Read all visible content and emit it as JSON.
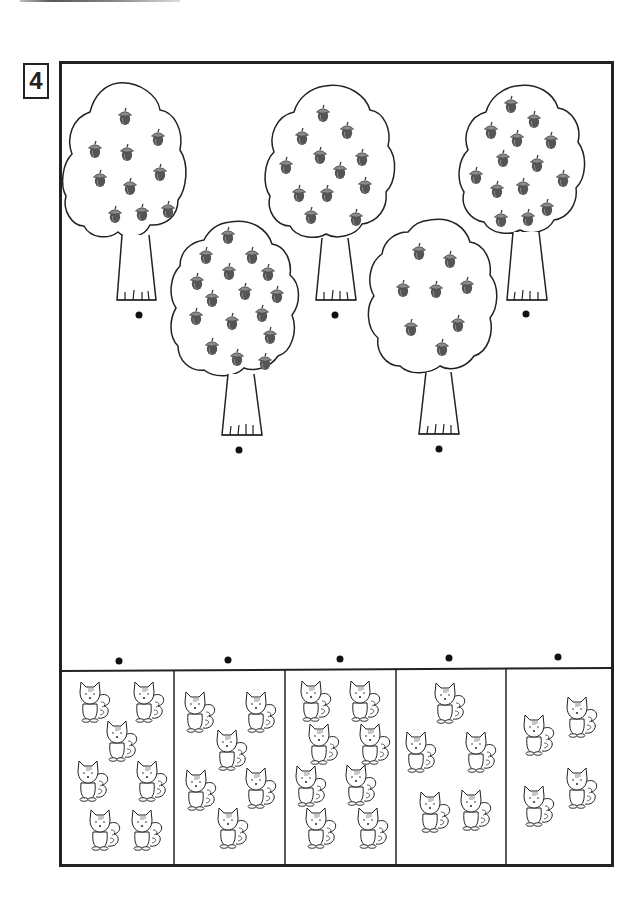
{
  "worksheet": {
    "exercise_number": "4",
    "instructions": "Match each tree to the box with the same number of squirrels as acorns/ by quantity (no visible text)",
    "trees": [
      {
        "id": "tree-1",
        "acorn_count": 10,
        "cx": 120,
        "cy": 175,
        "scale": 1.0,
        "dot": [
          139,
          315
        ]
      },
      {
        "id": "tree-2",
        "acorn_count": 15,
        "cx": 235,
        "cy": 300,
        "scale": 1.05,
        "dot": [
          239,
          450
        ]
      },
      {
        "id": "tree-3",
        "acorn_count": 12,
        "cx": 328,
        "cy": 165,
        "scale": 1.02,
        "dot": [
          335,
          315
        ]
      },
      {
        "id": "tree-4",
        "acorn_count": 8,
        "cx": 432,
        "cy": 300,
        "scale": 1.02,
        "dot": [
          439,
          449
        ]
      },
      {
        "id": "tree-5",
        "acorn_count": 14,
        "cx": 518,
        "cy": 160,
        "scale": 0.98,
        "dot": [
          526,
          314
        ]
      }
    ],
    "squirrel_boxes": [
      {
        "id": "box-1",
        "squirrel_count": 7,
        "dot": [
          119,
          661
        ]
      },
      {
        "id": "box-2",
        "squirrel_count": 6,
        "dot": [
          228,
          660
        ]
      },
      {
        "id": "box-3",
        "squirrel_count": 8,
        "dot": [
          340,
          659
        ]
      },
      {
        "id": "box-4",
        "squirrel_count": 5,
        "dot": [
          449,
          658
        ]
      },
      {
        "id": "box-5",
        "squirrel_count": 4,
        "dot": [
          558,
          657
        ]
      }
    ]
  },
  "colors": {
    "line": "#222222",
    "acorn_cap": "#8a8a8a",
    "acorn_body": "#555555"
  }
}
